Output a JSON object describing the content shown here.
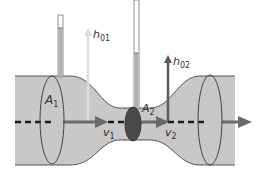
{
  "diagram": {
    "type": "venturi-tube",
    "labels": {
      "A1": {
        "main": "A",
        "sub": "1"
      },
      "A2": {
        "main": "A",
        "sub": "2"
      },
      "v1": {
        "main": "v",
        "sub": "1"
      },
      "v2": {
        "main": "v",
        "sub": "2"
      },
      "h01": {
        "main": "h",
        "sub": "01"
      },
      "h02": {
        "main": "h",
        "sub": "02"
      }
    },
    "colors": {
      "fluid": "#c8c8c8",
      "outline": "#555555",
      "tube_fluid": "#b0b0b0",
      "arrow_dark": "#5a5a5a",
      "arrow_light": "#d8d8d8",
      "throat_disc": "#4a4a4a",
      "dash": "#1a1a1a"
    }
  }
}
